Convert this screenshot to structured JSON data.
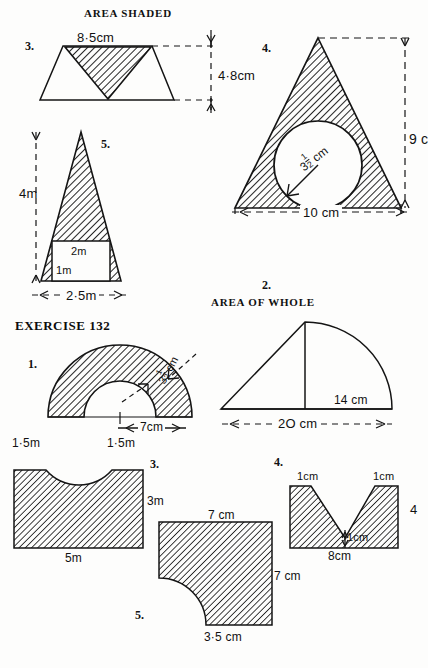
{
  "page": {
    "width": 422,
    "height": 668,
    "background": "#fdfdfc",
    "ink": "#111111"
  },
  "headings": {
    "area_shaded": "AREA SHADED",
    "area_of_whole": "AREA OF WHOLE",
    "exercise": "EXERCISE 132"
  },
  "area_shaded": {
    "q3": {
      "number": "3.",
      "shape": "trapezium-with-inscribed-inverted-triangle",
      "labels": {
        "top": "8·5cm",
        "height": "4·8cm"
      }
    },
    "q4": {
      "number": "4.",
      "shape": "triangle-with-inscribed-circle",
      "labels": {
        "radius": "3",
        "radius_fraction_num": "1",
        "radius_fraction_den": "2",
        "radius_unit": "cm",
        "height": "9 c",
        "base": "10 cm"
      }
    },
    "q5": {
      "number": "5.",
      "shape": "triangle-with-rectangular-hole",
      "labels": {
        "height": "4m",
        "inner_width": "2m",
        "inner_height": "1m",
        "base": "2·5m"
      }
    }
  },
  "area_of_whole": {
    "q2": {
      "number": "2.",
      "shape": "triangle-plus-quarter-circle",
      "labels": {
        "right_part": "14 cm",
        "total_base": "2O cm"
      }
    }
  },
  "exercise_132": {
    "q1": {
      "number": "1.",
      "shape": "semi-annulus",
      "labels": {
        "thickness": "3",
        "thickness_fraction_num": "1",
        "thickness_fraction_den": "2",
        "thickness_unit": "cm",
        "inner_radius": "7cm"
      }
    },
    "q3": {
      "number": "3.",
      "shape": "rectangle-with-semicircular-notch",
      "labels": {
        "left_top": "1·5m",
        "right_top": "1·5m",
        "height": "3m",
        "base": "5m"
      }
    },
    "q4": {
      "number": "4.",
      "shape": "rectangle-with-v-notch",
      "labels": {
        "left_top": "1cm",
        "right_top": "1cm",
        "notch_depth": "1cm",
        "base": "8cm",
        "height": "4"
      }
    },
    "q5": {
      "number": "5.",
      "shape": "square-with-quarter-circle-removed",
      "labels": {
        "top": "7 cm",
        "right": "7 cm",
        "bottom": "3·5 cm"
      }
    }
  }
}
